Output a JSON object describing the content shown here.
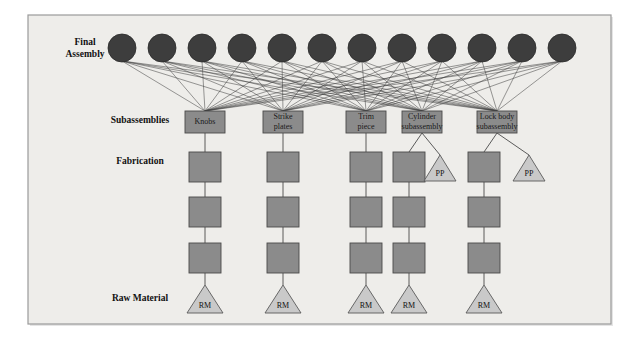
{
  "figure": {
    "background_color": "#ffffff",
    "panel_color": "#eeedea",
    "panel_border_color": "#9a9a9a",
    "panel": {
      "x": 28,
      "y": 15,
      "width": 583,
      "height": 309
    }
  },
  "colors": {
    "circle_fill": "#3d3d3d",
    "circle_stroke": "#2a2a2a",
    "box_fill": "#8b8b8b",
    "box_stroke": "#4a4a4a",
    "triangle_fill": "#c9c9c9",
    "triangle_stroke": "#5a5a5a",
    "link_color": "#3a3a3a",
    "text_color": "#111111"
  },
  "row_labels": [
    {
      "id": "final-assembly",
      "lines": [
        "Final",
        "Assembly"
      ],
      "x": 85,
      "y": 49
    },
    {
      "id": "subassemblies",
      "lines": [
        "Subassemblies"
      ],
      "x": 140,
      "y": 121
    },
    {
      "id": "fabrication",
      "lines": [
        "Fabrication"
      ],
      "x": 140,
      "y": 162
    },
    {
      "id": "raw-material",
      "lines": [
        "Raw Material"
      ],
      "x": 140,
      "y": 299
    }
  ],
  "final_assembly": {
    "label": "Final Assembly",
    "count": 12,
    "radius": 14,
    "cy": 48,
    "cx": [
      122,
      162,
      202,
      242,
      282,
      322,
      362,
      402,
      442,
      482,
      522,
      562
    ]
  },
  "subassemblies": {
    "label": "Subassemblies",
    "box": {
      "width": 40,
      "height": 22
    },
    "y": 111,
    "items": [
      {
        "id": "knobs",
        "lines": [
          "Knobs"
        ],
        "cx": 205
      },
      {
        "id": "strike-plates",
        "lines": [
          "Strike",
          "plates"
        ],
        "cx": 283
      },
      {
        "id": "trim-piece",
        "lines": [
          "Trim",
          "piece"
        ],
        "cx": 366
      },
      {
        "id": "cylinder-subassembly",
        "lines": [
          "Cylinder",
          "subassembly"
        ],
        "cx": 422
      },
      {
        "id": "lock-body-subassembly",
        "lines": [
          "Lock body",
          "subassembly"
        ],
        "cx": 497
      }
    ]
  },
  "fabrication": {
    "label": "Fabrication",
    "box": {
      "width": 32,
      "height": 30
    },
    "rows_y": [
      152,
      197,
      243
    ],
    "columns": [
      {
        "id": "fab-col-knobs",
        "cx": 205,
        "rows": 3,
        "parent": "knobs"
      },
      {
        "id": "fab-col-strike",
        "cx": 283,
        "rows": 3,
        "parent": "strike-plates"
      },
      {
        "id": "fab-col-trim",
        "cx": 366,
        "rows": 3,
        "parent": "trim-piece"
      },
      {
        "id": "fab-col-cylinder",
        "cx": 409,
        "rows": 3,
        "parent": "cylinder-subassembly"
      },
      {
        "id": "fab-col-lockbody",
        "cx": 484,
        "rows": 3,
        "parent": "lock-body-subassembly"
      }
    ]
  },
  "purchased_parts": {
    "label": "PP",
    "triangle": {
      "width": 32,
      "height": 26
    },
    "y": 155,
    "items": [
      {
        "id": "pp-cylinder",
        "text": "PP",
        "cx": 440,
        "parent": "cylinder-subassembly"
      },
      {
        "id": "pp-lockbody",
        "text": "PP",
        "cx": 529,
        "parent": "lock-body-subassembly"
      }
    ]
  },
  "raw_material": {
    "label": "Raw Material",
    "triangle": {
      "width": 36,
      "height": 28
    },
    "y": 285,
    "items": [
      {
        "id": "rm-knobs",
        "text": "RM",
        "cx": 205
      },
      {
        "id": "rm-strike",
        "text": "RM",
        "cx": 283
      },
      {
        "id": "rm-trim",
        "text": "RM",
        "cx": 366
      },
      {
        "id": "rm-cylinder",
        "text": "RM",
        "cx": 409
      },
      {
        "id": "rm-lockbody",
        "text": "RM",
        "cx": 484
      }
    ]
  },
  "network": {
    "description": "Each final-assembly circle connects to every subassembly node",
    "fully_connected": true
  }
}
